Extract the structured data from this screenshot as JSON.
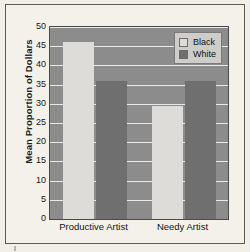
{
  "figure": {
    "background_color": "#f2efe9",
    "frame_color": "#5a5a5a"
  },
  "chart_data": {
    "type": "bar",
    "title": "",
    "subtitle": "",
    "xlabel": "",
    "ylabel": "Mean Proportion of Dollars",
    "categories": [
      "Productive Artist",
      "Needy Artist"
    ],
    "series": [
      {
        "name": "Black",
        "values": [
          46,
          29.5
        ],
        "color": "#dedcd8"
      },
      {
        "name": "White",
        "values": [
          36,
          36
        ],
        "color": "#6f6f6f"
      }
    ],
    "ylim": [
      0,
      50
    ],
    "ytick_labels": [
      "0",
      "5",
      "10",
      "15",
      "20",
      "25",
      "30",
      "35",
      "40",
      "45",
      "50"
    ],
    "ytick_values": [
      0,
      5,
      10,
      15,
      20,
      25,
      30,
      35,
      40,
      45,
      50
    ],
    "grid": true,
    "grid_color": "#e8e8e8",
    "grid_axis": "y",
    "legend_position": "top-right",
    "plot_background_color": "#8c8c8c",
    "annotations": []
  }
}
